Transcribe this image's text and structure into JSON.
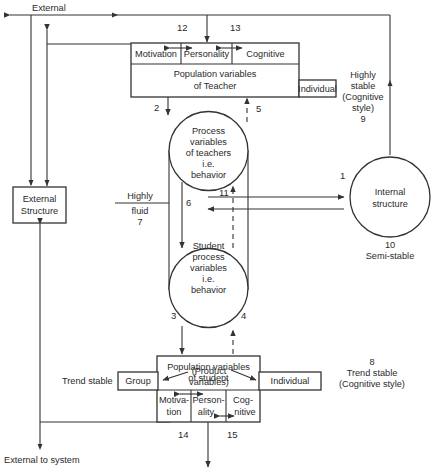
{
  "diagram": {
    "top_label": "External",
    "bottom_label": "External to system",
    "external_structure": [
      "External",
      "Structure"
    ],
    "teacher": {
      "cells": [
        "Motivation",
        "Personality",
        "Cognitive"
      ],
      "title": [
        "Population variables",
        "of Teacher"
      ],
      "individual": "Individual"
    },
    "teacher_process": [
      "Process",
      "variables",
      "of teachers",
      "i.e.",
      "behavior"
    ],
    "student_process": [
      "Student",
      "process",
      "variables",
      "i.e.",
      "behavior"
    ],
    "internal_structure": [
      "Internal",
      "structure"
    ],
    "internal_caption": {
      "number": "10",
      "text": "Semi-stable"
    },
    "highly_stable": [
      "Highly",
      "stable",
      "(Cognitive",
      "style)",
      "9"
    ],
    "highly_fluid": {
      "top": "Highly",
      "bottom": "fluid",
      "number": "7"
    },
    "student": {
      "title": [
        "Population variables",
        "of student"
      ],
      "product": [
        "(Product",
        "variables)"
      ],
      "group": "Group",
      "individual": "Individual",
      "cells": [
        [
          "Motiva-",
          "tion"
        ],
        [
          "Person-",
          "ality"
        ],
        [
          "Cog-",
          "nitive"
        ]
      ]
    },
    "trend_stable_left": "Trend stable",
    "trend_stable_right": {
      "number": "8",
      "lines": [
        "Trend stable",
        "(Cognitive style)"
      ]
    },
    "arrow_numbers": {
      "n1": "1",
      "n2": "2",
      "n3": "3",
      "n4": "4",
      "n5": "5",
      "n6": "6",
      "n11": "11",
      "n12": "12",
      "n13": "13",
      "n14": "14",
      "n15": "15"
    },
    "colors": {
      "line": "#333333",
      "text": "#2a2a2a",
      "background": "#ffffff"
    }
  }
}
